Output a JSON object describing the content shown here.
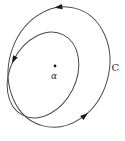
{
  "figure": {
    "background": "#ffffff",
    "curve_stroke_color": "#4a4a4a",
    "arrow_fill_color": "#1a1a1a",
    "label_color": "#2b2b2b",
    "point_label": "α",
    "curve_label": "C"
  }
}
